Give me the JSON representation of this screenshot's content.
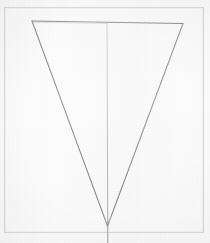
{
  "artwork": {
    "title": "Inverted Triangle with Median Line",
    "medium": "graphite line drawing on paper",
    "subject": "geometric-line-drawing",
    "canvas": {
      "width": 210,
      "height": 243
    }
  },
  "colors": {
    "paper_background": "#fcfcfc",
    "outer_background": "#ffffff",
    "frame_stroke": "#d8d8d8",
    "triangle_stroke": "#8d8f92",
    "triangle_stroke_light": "#a9abae",
    "median_stroke": "#c3c5c7",
    "median_stroke_lower": "#9b9da0"
  },
  "frame": {
    "name": "paper-border-rectangle",
    "x": 4,
    "y": 7,
    "width": 200,
    "height": 226,
    "stroke_width": 1
  },
  "shapes": [
    {
      "id": "triangle",
      "name": "inverted-triangle",
      "type": "polygon",
      "closed": false,
      "points": [
        {
          "label": "top-left-vertex",
          "x": 32,
          "y": 21
        },
        {
          "label": "top-right-vertex",
          "x": 183,
          "y": 23.5
        },
        {
          "label": "bottom-apex",
          "x": 107.5,
          "y": 226
        }
      ],
      "stroke_width": 1
    },
    {
      "id": "median",
      "name": "vertical-median-line",
      "type": "line",
      "x1": 107,
      "y1": 22,
      "x2": 107.8,
      "y2": 243,
      "stroke_width": 1
    }
  ],
  "edges": [
    {
      "name": "top-edge",
      "from": "top-left-vertex",
      "to": "top-right-vertex"
    },
    {
      "name": "left-edge",
      "from": "top-left-vertex",
      "to": "bottom-apex"
    },
    {
      "name": "right-edge",
      "from": "top-right-vertex",
      "to": "bottom-apex"
    }
  ]
}
